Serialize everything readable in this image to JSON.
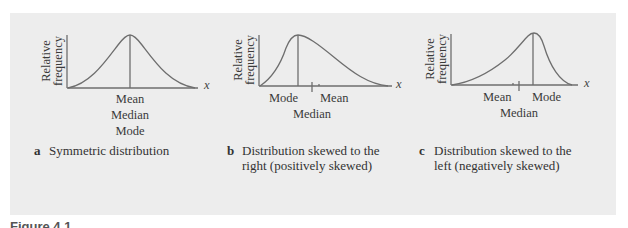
{
  "figure_number": "Figure 4.1",
  "y_axis_label": [
    "Relative",
    "frequency"
  ],
  "x_axis_symbol": "x",
  "panels": [
    {
      "letter": "a",
      "caption": "Symmetric distribution",
      "labels": [
        "Mean",
        "Median",
        "Mode"
      ]
    },
    {
      "letter": "b",
      "caption": "Distribution skewed to the right (positively skewed)",
      "caption_lines": [
        "Distribution skewed to the",
        "right (positively skewed)"
      ],
      "labels": {
        "mode": "Mode",
        "mean": "Mean",
        "median": "Median"
      }
    },
    {
      "letter": "c",
      "caption": "Distribution skewed to the left (negatively skewed)",
      "caption_lines": [
        "Distribution skewed to the",
        "left (negatively skewed)"
      ],
      "labels": {
        "mean": "Mean",
        "mode": "Mode",
        "median": "Median"
      }
    }
  ],
  "colors": {
    "panel_bg": "#ededed",
    "curve": "#6e6e6e",
    "text": "#333333"
  }
}
